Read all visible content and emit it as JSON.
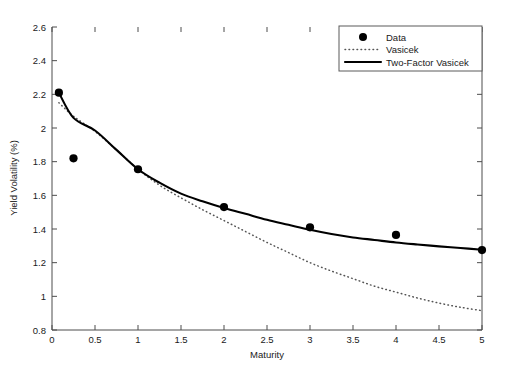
{
  "chart_data": {
    "type": "line",
    "title": "",
    "xlabel": "Maturity",
    "ylabel": "Yield Volatility (%)",
    "xlim": [
      0,
      5
    ],
    "ylim": [
      0.8,
      2.6
    ],
    "xticks": [
      "0",
      "0.5",
      "1",
      "1.5",
      "2",
      "2.5",
      "3",
      "3.5",
      "4",
      "4.5",
      "5"
    ],
    "xtick_values": [
      0,
      0.5,
      1,
      1.5,
      2,
      2.5,
      3,
      3.5,
      4,
      4.5,
      5
    ],
    "yticks": [
      "0.8",
      "1",
      "1.2",
      "1.4",
      "1.6",
      "1.8",
      "2",
      "2.2",
      "2.4",
      "2.6"
    ],
    "ytick_values": [
      0.8,
      1,
      1.2,
      1.4,
      1.6,
      1.8,
      2,
      2.2,
      2.4,
      2.6
    ],
    "grid": false,
    "legend_position": "top-right",
    "legend_entries": [
      "Data",
      "Vasicek",
      "Two-Factor Vasicek"
    ],
    "series": [
      {
        "name": "Data",
        "style": "markers",
        "marker": "filled-circle",
        "color": "#000000",
        "x": [
          0.08,
          0.25,
          1.0,
          2.0,
          3.0,
          4.0,
          5.0
        ],
        "values": [
          2.21,
          1.82,
          1.755,
          1.53,
          1.41,
          1.365,
          1.275
        ]
      },
      {
        "name": "Vasicek",
        "style": "dotted",
        "color": "#555555",
        "x": [
          0.08,
          0.25,
          0.5,
          0.75,
          1.0,
          1.25,
          1.5,
          1.75,
          2.0,
          2.25,
          2.5,
          2.75,
          3.0,
          3.25,
          3.5,
          3.75,
          4.0,
          4.25,
          4.5,
          4.75,
          5.0
        ],
        "values": [
          2.15,
          2.07,
          1.98,
          1.87,
          1.755,
          1.66,
          1.585,
          1.515,
          1.45,
          1.385,
          1.32,
          1.26,
          1.2,
          1.15,
          1.105,
          1.06,
          1.025,
          0.99,
          0.96,
          0.935,
          0.915
        ]
      },
      {
        "name": "Two-Factor Vasicek",
        "style": "solid",
        "color": "#000000",
        "x": [
          0.08,
          0.25,
          0.5,
          0.75,
          1.0,
          1.25,
          1.5,
          1.75,
          2.0,
          2.25,
          2.5,
          2.75,
          3.0,
          3.25,
          3.5,
          3.75,
          4.0,
          4.25,
          4.5,
          4.75,
          5.0
        ],
        "values": [
          2.21,
          2.06,
          1.985,
          1.87,
          1.755,
          1.675,
          1.61,
          1.565,
          1.525,
          1.49,
          1.455,
          1.425,
          1.395,
          1.37,
          1.35,
          1.335,
          1.32,
          1.308,
          1.297,
          1.287,
          1.277
        ]
      }
    ]
  }
}
